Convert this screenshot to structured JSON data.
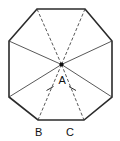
{
  "figure": {
    "shape_name": "regular-octagon",
    "background_color": "#ffffff",
    "stroke_color": "#2b2b2b",
    "diagonal_color": "#3a3a3a",
    "label_color": "#111111"
  },
  "labels": {
    "center": "A",
    "vertex_left": "B",
    "vertex_right": "C"
  },
  "geometry": {
    "center": {
      "x": 61.5,
      "y": 64.5
    },
    "vertices": [
      {
        "name": "top-left",
        "x": 37.0,
        "y": 9.0
      },
      {
        "name": "top-right",
        "x": 85.0,
        "y": 9.0
      },
      {
        "name": "right-top",
        "x": 112.0,
        "y": 41.0
      },
      {
        "name": "right-bottom",
        "x": 112.0,
        "y": 97.0
      },
      {
        "name": "bottom-right",
        "x": 84.0,
        "y": 120.0
      },
      {
        "name": "bottom-left",
        "x": 38.0,
        "y": 120.0
      },
      {
        "name": "left-bottom",
        "x": 9.0,
        "y": 97.0
      },
      {
        "name": "left-top",
        "x": 9.0,
        "y": 41.0
      }
    ],
    "radii_count": 8,
    "tick_marked_radii": [
      "A-B",
      "A-C"
    ],
    "tick_marks": [
      {
        "on": "A-B",
        "x": 50.0,
        "y": 89.0
      },
      {
        "on": "A-C",
        "x": 72.5,
        "y": 89.0
      }
    ]
  }
}
